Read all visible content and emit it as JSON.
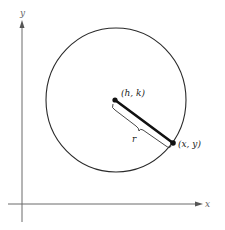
{
  "diagram": {
    "type": "circle-standard-form",
    "labels": {
      "x_axis": "x",
      "y_axis": "y",
      "center": "(h, k)",
      "point": "(x, y)",
      "radius": "r"
    },
    "colors": {
      "axis": "#6b6b6b",
      "circle": "#2a2a2a",
      "radius": "#111111",
      "background": "#ffffff"
    }
  }
}
